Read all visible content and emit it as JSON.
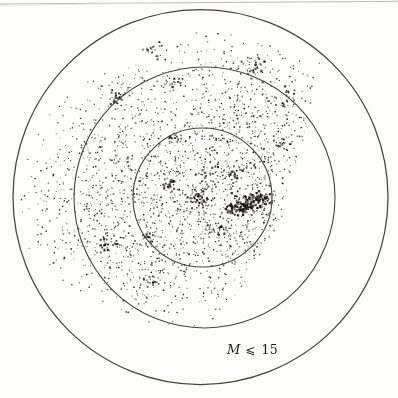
{
  "figure": {
    "width": 398,
    "height": 398,
    "background": "#fcfcfa",
    "artifact_lines": [
      {
        "x1": 0,
        "y1": 4.0,
        "x2": 398,
        "y2": 1.3,
        "color": "#b6b4b0",
        "width": 0.9
      },
      {
        "x1": 0,
        "y1": 5.5,
        "x2": 160,
        "y2": 3.0,
        "color": "#e4e2de",
        "width": 0.8
      }
    ]
  },
  "chart_data": {
    "type": "scatter",
    "annotation": {
      "variable": "M",
      "relation": "⩽",
      "value": "15",
      "x": 227,
      "y": 341
    },
    "dot_color": "#161310",
    "circle_color": "#48443d",
    "circles": [
      {
        "name": "outer-circle",
        "cx": 200.5,
        "cy": 197.0,
        "r": 187.5,
        "stroke_width": 1.25
      },
      {
        "name": "middle-circle",
        "cx": 204.5,
        "cy": 197.5,
        "r": 130.5,
        "stroke_width": 1.1
      },
      {
        "name": "inner-circle",
        "cx": 202.5,
        "cy": 197.5,
        "r": 69.5,
        "stroke_width": 1.1
      }
    ],
    "seed": 1337,
    "clusters": [
      {
        "x": 190,
        "y": 148,
        "sx": 72,
        "sy": 62,
        "n": 700,
        "size": 1.0
      },
      {
        "x": 212,
        "y": 205,
        "sx": 58,
        "sy": 48,
        "n": 520,
        "size": 1.0
      },
      {
        "x": 140,
        "y": 232,
        "sx": 58,
        "sy": 46,
        "n": 330,
        "size": 1.0
      },
      {
        "x": 118,
        "y": 142,
        "sx": 52,
        "sy": 58,
        "n": 230,
        "size": 1.0
      },
      {
        "x": 255,
        "y": 95,
        "sx": 45,
        "sy": 38,
        "n": 240,
        "size": 1.0
      },
      {
        "x": 255,
        "y": 150,
        "sx": 34,
        "sy": 28,
        "n": 190,
        "size": 1.0
      },
      {
        "x": 90,
        "y": 210,
        "sx": 38,
        "sy": 55,
        "n": 140,
        "size": 0.95
      },
      {
        "x": 170,
        "y": 282,
        "sx": 45,
        "sy": 22,
        "n": 110,
        "size": 0.95
      },
      {
        "x": 250,
        "y": 240,
        "sx": 28,
        "sy": 24,
        "n": 90,
        "size": 1.0
      },
      {
        "x": 247,
        "y": 205,
        "sx": 7,
        "sy": 5,
        "n": 90,
        "size": 1.6
      },
      {
        "x": 261,
        "y": 199,
        "sx": 5,
        "sy": 4,
        "n": 55,
        "size": 1.6
      },
      {
        "x": 234,
        "y": 208,
        "sx": 5,
        "sy": 4,
        "n": 45,
        "size": 1.5
      },
      {
        "x": 199,
        "y": 199,
        "sx": 6,
        "sy": 5,
        "n": 45,
        "size": 1.4
      },
      {
        "x": 170,
        "y": 185,
        "sx": 5,
        "sy": 4,
        "n": 28,
        "size": 1.4
      },
      {
        "x": 255,
        "y": 67,
        "sx": 6,
        "sy": 4,
        "n": 32,
        "size": 1.5
      },
      {
        "x": 152,
        "y": 48,
        "sx": 6,
        "sy": 4,
        "n": 24,
        "size": 1.4
      },
      {
        "x": 118,
        "y": 96,
        "sx": 4,
        "sy": 4,
        "n": 20,
        "size": 1.5
      },
      {
        "x": 172,
        "y": 83,
        "sx": 4,
        "sy": 3,
        "n": 16,
        "size": 1.4
      },
      {
        "x": 282,
        "y": 143,
        "sx": 5,
        "sy": 4,
        "n": 20,
        "size": 1.4
      },
      {
        "x": 215,
        "y": 230,
        "sx": 6,
        "sy": 5,
        "n": 28,
        "size": 1.4
      },
      {
        "x": 290,
        "y": 96,
        "sx": 5,
        "sy": 5,
        "n": 18,
        "size": 1.3
      },
      {
        "x": 107,
        "y": 245,
        "sx": 5,
        "sy": 4,
        "n": 22,
        "size": 1.4
      },
      {
        "x": 150,
        "y": 282,
        "sx": 5,
        "sy": 4,
        "n": 20,
        "size": 1.4
      },
      {
        "x": 148,
        "y": 238,
        "sx": 4,
        "sy": 3,
        "n": 14,
        "size": 1.4
      },
      {
        "x": 177,
        "y": 139,
        "sx": 4,
        "sy": 3,
        "n": 14,
        "size": 1.4
      },
      {
        "x": 210,
        "y": 176,
        "sx": 5,
        "sy": 4,
        "n": 18,
        "size": 1.4
      },
      {
        "x": 233,
        "y": 175,
        "sx": 5,
        "sy": 3,
        "n": 18,
        "size": 1.5
      },
      {
        "x": 150,
        "y": 200,
        "sx": 110,
        "sy": 100,
        "n": 170,
        "size": 0.9
      }
    ],
    "bounds": {
      "clip_circle": {
        "cx": 200.5,
        "cy": 197.0,
        "r": 184
      },
      "xmax_by_y": [
        [
          25,
          320
        ],
        [
          60,
          325
        ],
        [
          100,
          312
        ],
        [
          140,
          304
        ],
        [
          180,
          291
        ],
        [
          220,
          282
        ],
        [
          250,
          263
        ],
        [
          280,
          246
        ],
        [
          300,
          233
        ],
        [
          320,
          216
        ],
        [
          345,
          200
        ]
      ],
      "ymin_by_x": [
        [
          13,
          175
        ],
        [
          35,
          132
        ],
        [
          60,
          100
        ],
        [
          90,
          80
        ],
        [
          120,
          62
        ],
        [
          150,
          45
        ],
        [
          180,
          33
        ],
        [
          215,
          30
        ],
        [
          250,
          39
        ],
        [
          285,
          50
        ],
        [
          315,
          58
        ],
        [
          340,
          72
        ]
      ],
      "ymax_by_x": [
        [
          13,
          228
        ],
        [
          40,
          262
        ],
        [
          70,
          286
        ],
        [
          100,
          303
        ],
        [
          130,
          316
        ],
        [
          160,
          326
        ],
        [
          200,
          334
        ],
        [
          230,
          312
        ],
        [
          255,
          282
        ],
        [
          275,
          252
        ],
        [
          300,
          233
        ],
        [
          335,
          207
        ]
      ]
    }
  }
}
